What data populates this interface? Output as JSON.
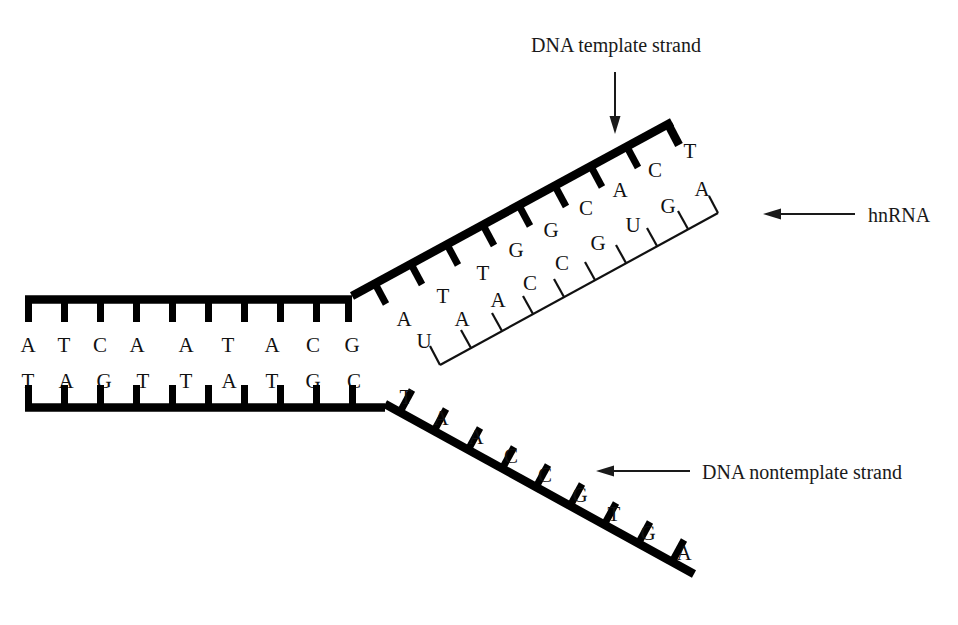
{
  "figure": {
    "background_color": "#ffffff",
    "ink_color": "#000000"
  },
  "labels": {
    "template": "DNA template strand",
    "hnrna": "hnRNA",
    "nontemplate": "DNA nontemplate strand"
  },
  "duplex": {
    "top_strand_name": "DNA template strand (duplex region)",
    "bottom_strand_name": "DNA nontemplate strand (duplex region)",
    "top_bases": [
      "A",
      "T",
      "C",
      "A",
      "A",
      "T",
      "A",
      "C",
      "G"
    ],
    "bottom_bases": [
      "T",
      "A",
      "G",
      "T",
      "T",
      "A",
      "T",
      "G",
      "C"
    ]
  },
  "template_branch": {
    "name": "DNA template strand (unwound arm)",
    "bases": [
      "A",
      "T",
      "T",
      "G",
      "G",
      "C",
      "A",
      "C",
      "T"
    ]
  },
  "rna_branch": {
    "name": "hnRNA transcript",
    "bases": [
      "U",
      "A",
      "A",
      "C",
      "C",
      "G",
      "U",
      "G",
      "A"
    ]
  },
  "nontemplate_branch": {
    "name": "DNA nontemplate strand (unwound arm)",
    "bases": [
      "T",
      "A",
      "A",
      "C",
      "C",
      "G",
      "T",
      "G",
      "A"
    ]
  }
}
